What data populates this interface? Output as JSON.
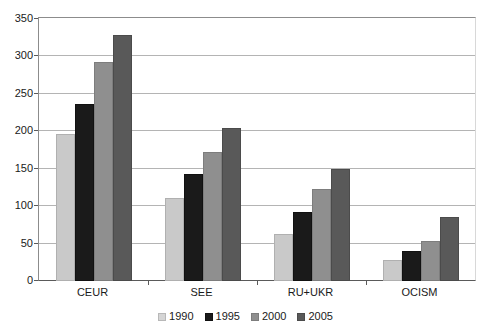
{
  "chart_data": {
    "type": "bar",
    "title": "",
    "subtitle": "",
    "xlabel": "",
    "ylabel": "",
    "categories": [
      "CEUR",
      "SEE",
      "RU+UKR",
      "OCISM"
    ],
    "series": [
      {
        "name": "1990",
        "color": "#c9c9c9",
        "values": [
          197,
          111,
          63,
          28
        ]
      },
      {
        "name": "1995",
        "color": "#1a1a1a",
        "values": [
          237,
          143,
          92,
          40
        ]
      },
      {
        "name": "2000",
        "color": "#8f8f8f",
        "values": [
          292,
          173,
          123,
          53
        ]
      },
      {
        "name": "2005",
        "color": "#595959",
        "values": [
          328,
          204,
          150,
          85
        ]
      }
    ],
    "ylim": [
      0,
      350
    ],
    "ytick_step": 50,
    "yticks": [
      0,
      50,
      100,
      150,
      200,
      250,
      300,
      350
    ],
    "ytick_labels": [
      "0",
      "50",
      "100",
      "150",
      "200",
      "250",
      "300",
      "350"
    ],
    "grid": true,
    "grid_axis": "y",
    "legend_position": "bottom-center",
    "legend_entries": [
      "1990",
      "1995",
      "2000",
      "2005"
    ],
    "background_color": "#ffffff",
    "axis_color": "#5a5a5a",
    "gridline_color": "#b4b4b4"
  }
}
